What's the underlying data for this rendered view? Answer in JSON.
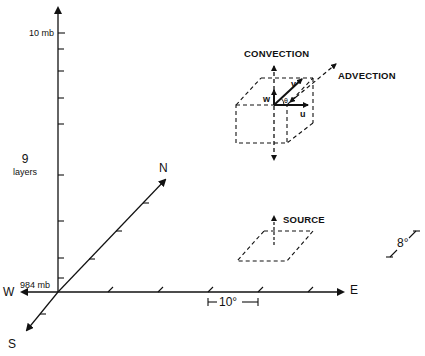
{
  "diagram": {
    "vertical_axis": {
      "top_label": "10 mb",
      "bottom_label": "984 mb",
      "layer_count": "9",
      "layer_word": "layers"
    },
    "horizontal_axes": {
      "west": "W",
      "east": "E",
      "north": "N",
      "south": "S"
    },
    "scales": {
      "longitude_spacing": "10°",
      "latitude_spacing": "8°"
    },
    "grid_cell": {
      "convection_label": "CONVECTION",
      "advection_label": "ADVECTION",
      "vectors": {
        "u": "u",
        "v": "v",
        "w": "w",
        "theta": "θ"
      }
    },
    "source": {
      "label": "SOURCE"
    }
  }
}
